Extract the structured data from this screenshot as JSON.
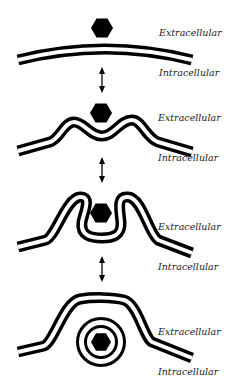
{
  "diagram": {
    "colors": {
      "membrane": "#000000",
      "cargo": "#000000",
      "background": "#ffffff",
      "label": "#222222"
    },
    "stages": [
      {
        "name": "cargo-approaches-membrane",
        "extracellular_label": "Extracellular",
        "intracellular_label": "Intracellular",
        "cargo_icon": "hexagon-icon"
      },
      {
        "name": "membrane-invagination",
        "extracellular_label": "Extracellular",
        "intracellular_label": "Intracellular",
        "cargo_icon": "hexagon-icon"
      },
      {
        "name": "membrane-engulfing-cargo",
        "extracellular_label": "Extracellular",
        "intracellular_label": "Intracellular",
        "cargo_icon": "hexagon-icon"
      },
      {
        "name": "vesicle-formed",
        "extracellular_label": "Extracellular",
        "intracellular_label": "Intracellular",
        "cargo_icon": "hexagon-icon"
      }
    ],
    "transition_icon": "double-headed-arrow-icon"
  }
}
